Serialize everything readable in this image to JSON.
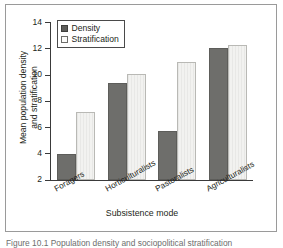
{
  "figure": {
    "caption": "Figure 10.1  Population density and sociopolitical stratification"
  },
  "chart_data": {
    "type": "bar",
    "title": "",
    "xlabel": "Subsistence mode",
    "ylabel": "Mean population density and stratification",
    "ylabel_line1": "Mean population density",
    "ylabel_line2": "and stratification",
    "categories": [
      "Foragers",
      "Horticulturalists",
      "Pastoralists",
      "Agriculturalists"
    ],
    "series": [
      {
        "name": "Density",
        "values": [
          4.0,
          9.4,
          5.7,
          12.05
        ],
        "color": "#6e6e6b"
      },
      {
        "name": "Stratification",
        "values": [
          7.2,
          10.05,
          11.0,
          12.3
        ],
        "color": "#f2f2f0"
      }
    ],
    "ylim": [
      2,
      14
    ],
    "yticks": [
      2,
      4,
      6,
      8,
      10,
      12,
      14
    ],
    "ytick_labels": [
      "2",
      "4",
      "6",
      "8",
      "10",
      "12",
      "14"
    ],
    "grid": false,
    "legend_position": "upper-left",
    "legend_entries": [
      "Density",
      "Stratification"
    ]
  }
}
